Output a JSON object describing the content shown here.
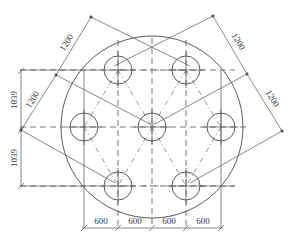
{
  "drawing": {
    "title": "Pile cap layout plan",
    "colors": {
      "line": "#4a4a4a",
      "text": "#3a3a3a",
      "background": "#ffffff"
    },
    "outer_circle": {
      "cx": 152,
      "cy": 127,
      "r": 91
    },
    "piles": [
      {
        "id": "top-left",
        "cx": 118,
        "cy": 70
      },
      {
        "id": "top-right",
        "cx": 186,
        "cy": 70
      },
      {
        "id": "mid-left",
        "cx": 84,
        "cy": 127
      },
      {
        "id": "center",
        "cx": 152,
        "cy": 127
      },
      {
        "id": "mid-right",
        "cx": 221,
        "cy": 127
      },
      {
        "id": "bottom-left",
        "cx": 118,
        "cy": 186
      },
      {
        "id": "bottom-right",
        "cx": 186,
        "cy": 186
      }
    ],
    "pile_radius": 14,
    "dimensions": {
      "bottom": [
        "600",
        "600",
        "600",
        "600"
      ],
      "left": [
        "1039",
        "1039"
      ],
      "diagonal_left": [
        "1200",
        "1200"
      ],
      "diagonal_right": [
        "1200",
        "1200"
      ]
    }
  }
}
